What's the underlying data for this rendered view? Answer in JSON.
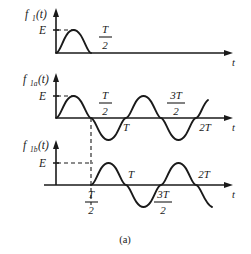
{
  "figure": {
    "caption": "(a)",
    "background": "#ffffff",
    "ink": "#1a1a1a",
    "panels": [
      {
        "id": "panel-1",
        "function_label": "f",
        "function_sub": "1",
        "function_arg": "(t)",
        "amplitude_label": "E",
        "axis_label": "t",
        "tick_labels": [
          {
            "name": "half-period",
            "numerator": "T",
            "denominator": "2",
            "position": "above-axis"
          }
        ],
        "description": "single half-sine pulse from 0 to T/2"
      },
      {
        "id": "panel-2",
        "function_label": "f",
        "function_sub": "1a",
        "function_arg": "(t)",
        "amplitude_label": "E",
        "axis_label": "t",
        "tick_labels": [
          {
            "name": "half-period",
            "numerator": "T",
            "denominator": "2",
            "position": "above-axis"
          },
          {
            "name": "period",
            "text": "T",
            "position": "below-axis"
          },
          {
            "name": "three-half-period",
            "numerator": "3T",
            "denominator": "2",
            "position": "above-axis"
          },
          {
            "name": "two-period",
            "text": "2T",
            "position": "below-axis"
          }
        ],
        "description": "continuous sine wave starting at origin spanning two periods"
      },
      {
        "id": "panel-3",
        "function_label": "f",
        "function_sub": "1b",
        "function_arg": "(t)",
        "amplitude_label": "E",
        "axis_label": "t",
        "tick_labels": [
          {
            "name": "half-period",
            "numerator": "T",
            "denominator": "2",
            "position": "below-axis"
          },
          {
            "name": "period",
            "text": "T",
            "position": "above-axis"
          },
          {
            "name": "three-half-period",
            "numerator": "3T",
            "denominator": "2",
            "position": "below-axis"
          },
          {
            "name": "two-period",
            "text": "2T",
            "position": "above-axis"
          }
        ],
        "description": "sine wave shifted right by T/2, starting at T/2"
      }
    ]
  }
}
